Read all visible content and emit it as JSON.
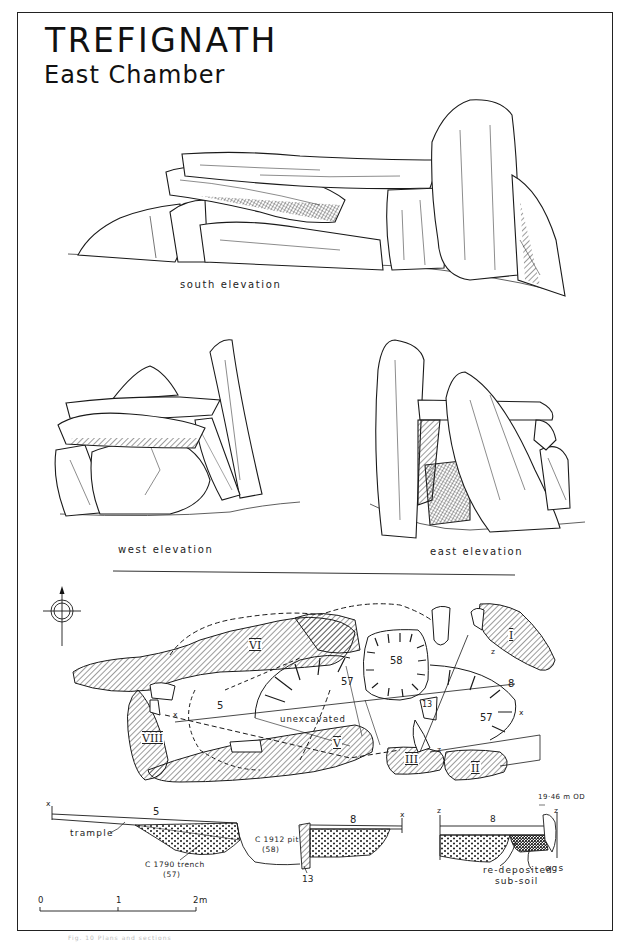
{
  "header": {
    "title": "TREFIGNATH",
    "subtitle": "East Chamber"
  },
  "elevations": {
    "south": "south elevation",
    "west": "west elevation",
    "east": "east elevation"
  },
  "plan": {
    "north_arrow": "north-arrow",
    "stones": {
      "I": "I",
      "II": "II",
      "III": "III",
      "V": "V",
      "VI": "VI",
      "VIII": "VIII"
    },
    "contexts": {
      "c5": "5",
      "c57a": "57",
      "c58": "58",
      "c13": "13",
      "c8": "8",
      "c57b": "57",
      "unexcavated": "unexcavated"
    },
    "section_markers": {
      "x_left": "x",
      "x_right": "x",
      "z_top": "z",
      "z_bottom": "z"
    }
  },
  "section_xx": {
    "x_left": "x",
    "x_right": "x",
    "layer_5": "5",
    "layer_8": "8",
    "trample": "trample",
    "trench_label": "C 1790 trench",
    "trench_num": "(57)",
    "pit_label": "C 1912 pit",
    "pit_num": "(58)",
    "stone_13": "13"
  },
  "section_zz": {
    "z_left": "z",
    "z_right": "z",
    "layer_8": "8",
    "datum": "19·46 m OD",
    "redeposited_1": "re-deposited",
    "redeposited_2": "sub-soil",
    "ogs": "ogs"
  },
  "scale_bar": {
    "ticks": [
      "0",
      "1",
      "2m"
    ]
  },
  "caption": "Fig. 10   Plans and sections"
}
